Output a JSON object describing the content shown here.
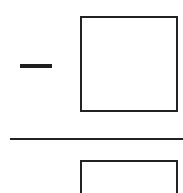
{
  "expression": {
    "sign": "−",
    "numerator": {
      "value": "",
      "placeholder": ""
    },
    "denominator": {
      "value": "",
      "placeholder": ""
    }
  },
  "colors": {
    "stroke": "#222222",
    "background": "#ffffff"
  }
}
